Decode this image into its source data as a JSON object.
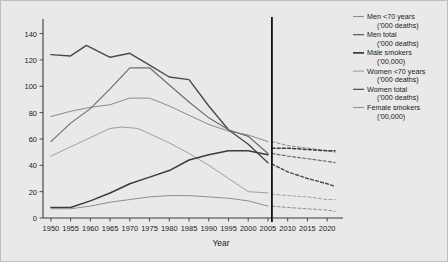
{
  "figure": {
    "background_color": "#e9e9e9",
    "border_color": "#bdbdbd",
    "axis_color": "#3a3a3a",
    "marker_line_label": "projection-divider"
  },
  "chart_data": {
    "type": "line",
    "title": "",
    "xlabel": "Year",
    "ylabel": "",
    "xlim": [
      1948,
      2023
    ],
    "ylim": [
      0,
      148
    ],
    "ytick_labels": [
      "0",
      "20",
      "40",
      "60",
      "80",
      "100",
      "120",
      "140"
    ],
    "yticks": [
      0,
      20,
      40,
      60,
      80,
      100,
      120,
      140
    ],
    "xtick_labels": [
      "1950",
      "1955",
      "1960",
      "1965",
      "1970",
      "1975",
      "1980",
      "1985",
      "1990",
      "1995",
      "2000",
      "2005",
      "2010",
      "2015",
      "2020"
    ],
    "xticks": [
      1950,
      1955,
      1960,
      1965,
      1970,
      1975,
      1980,
      1985,
      1990,
      1995,
      2000,
      2005,
      2010,
      2015,
      2020
    ],
    "grid": false,
    "legend_position": "right",
    "annotations": [
      {
        "name": "vertical-divider",
        "x": 2006,
        "style": "solid",
        "color": "#111111",
        "note": "separates observed data (left) from dashed projections (right)"
      }
    ],
    "series": [
      {
        "name": "Men <70 years",
        "units": "('000 deaths)",
        "color": "#8a8a8a",
        "width": 1.0,
        "x": [
          1950,
          1955,
          1960,
          1965,
          1970,
          1975,
          1980,
          1985,
          1990,
          1995,
          2000,
          2005
        ],
        "values": [
          77,
          81,
          84,
          86,
          91,
          91,
          85,
          78,
          71,
          66,
          63,
          58
        ],
        "projection_x": [
          2006,
          2010,
          2015,
          2020,
          2022
        ],
        "projection_values": [
          58,
          55,
          53,
          51,
          50
        ]
      },
      {
        "name": "Men total",
        "units": "('000 deaths)",
        "color": "#4a4a4a",
        "width": 1.4,
        "x": [
          1950,
          1955,
          1959,
          1965,
          1970,
          1975,
          1980,
          1985,
          1990,
          1995,
          2000,
          2005
        ],
        "values": [
          124,
          123,
          131,
          122,
          125,
          116,
          107,
          105,
          85,
          67,
          56,
          42
        ],
        "projection_x": [
          2006,
          2010,
          2015,
          2020,
          2022
        ],
        "projection_values": [
          41,
          35,
          30,
          26,
          24
        ]
      },
      {
        "name": "Male smokers",
        "units": "('00,000)",
        "color": "#6e6e6e",
        "width": 1.2,
        "x": [
          1950,
          1955,
          1960,
          1965,
          1970,
          1975,
          1980,
          1985,
          1990,
          1995,
          2000,
          2005
        ],
        "values": [
          58,
          72,
          83,
          98,
          114,
          114,
          101,
          88,
          76,
          67,
          62,
          49
        ],
        "projection_x": [
          2006,
          2010,
          2015,
          2020,
          2022
        ],
        "projection_values": [
          49,
          47,
          45,
          43,
          42
        ]
      },
      {
        "name": "Women <70 years",
        "units": "('000 deaths)",
        "color": "#a0a0a0",
        "width": 1.0,
        "x": [
          1950,
          1955,
          1960,
          1965,
          1968,
          1972,
          1975,
          1980,
          1985,
          1990,
          1995,
          2000,
          2005
        ],
        "values": [
          47,
          54,
          61,
          68,
          69,
          68,
          64,
          57,
          49,
          40,
          30,
          20,
          19
        ],
        "projection_x": [
          2006,
          2010,
          2015,
          2020,
          2022
        ],
        "projection_values": [
          18,
          17,
          16,
          14,
          14
        ]
      },
      {
        "name": "Women total",
        "units": "('000 deaths)",
        "color": "#3c3c3c",
        "width": 1.5,
        "x": [
          1950,
          1955,
          1960,
          1965,
          1970,
          1975,
          1980,
          1985,
          1990,
          1995,
          1998,
          2000,
          2005
        ],
        "values": [
          8,
          8,
          13,
          19,
          26,
          31,
          36,
          44,
          48,
          51,
          51,
          51,
          48
        ],
        "projection_x": [
          2006,
          2010,
          2015,
          2020,
          2022
        ],
        "projection_values": [
          53,
          53,
          52,
          51,
          51
        ]
      },
      {
        "name": "Female smokers",
        "units": "('00,000)",
        "color": "#8f8f8f",
        "width": 1.0,
        "x": [
          1950,
          1955,
          1960,
          1965,
          1970,
          1975,
          1980,
          1985,
          1990,
          1995,
          2000,
          2005
        ],
        "values": [
          7,
          7,
          9,
          12,
          14,
          16,
          17,
          17,
          16,
          15,
          13,
          9
        ],
        "projection_x": [
          2006,
          2010,
          2015,
          2020,
          2022
        ],
        "projection_values": [
          9,
          8,
          7,
          6,
          5
        ]
      }
    ]
  },
  "legend": {
    "entries": [
      {
        "label": "Men <70 years",
        "units": "('000 deaths)",
        "color": "#8a8a8a"
      },
      {
        "label": "Men total",
        "units": "('000 deaths)",
        "color": "#4a4a4a"
      },
      {
        "label": "Male smokers",
        "units": "('00,000)",
        "color": "#2e2e2e"
      },
      {
        "label": "Women <70 years",
        "units": "('000 deaths)",
        "color": "#a0a0a0"
      },
      {
        "label": "Women total",
        "units": "('000 deaths)",
        "color": "#3c3c3c"
      },
      {
        "label": "Female smokers",
        "units": "('00,000)",
        "color": "#8f8f8f"
      }
    ]
  }
}
